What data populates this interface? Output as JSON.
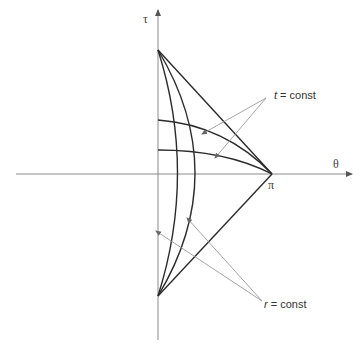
{
  "diagram": {
    "type": "penrose-style conformal diagram",
    "axes": {
      "vertical_label": "τ",
      "horizontal_label": "θ",
      "horizontal_tick_label": "π"
    },
    "annotations": [
      {
        "text_italic": "t",
        "text_rest": " = const",
        "points_to": "constant-time curves (horizontal arcs)"
      },
      {
        "text_italic": "r",
        "text_rest": " = const",
        "points_to": "constant-radius curves (vertical arcs)"
      }
    ],
    "colors": {
      "curve": "#2b2b2b",
      "axis": "#888888",
      "pointer": "#999999"
    }
  }
}
